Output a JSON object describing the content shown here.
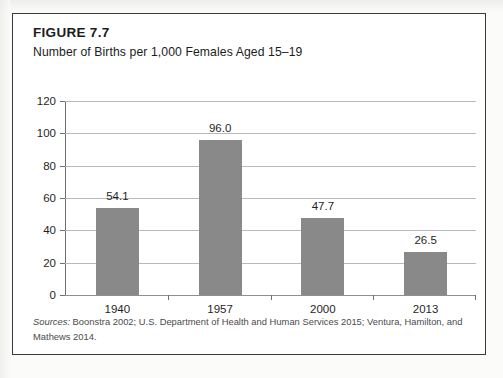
{
  "figure": {
    "label": "FIGURE 7.7",
    "title": "Number of Births per 1,000 Females Aged 15–19",
    "source_lead": "Sources:",
    "source_text": " Boonstra 2002; U.S. Department of Health and Human Services 2015; Ventura, Hamilton, and Mathews 2014."
  },
  "colors": {
    "bar_fill": "#898989",
    "frame": "#3a3a3a",
    "gridline": "#b9b9b9",
    "axis": "#6f6f6f",
    "text": "#1c1c1c"
  },
  "chart_data": {
    "type": "bar",
    "title": "Number of Births per 1,000 Females Aged 15–19",
    "xlabel": "",
    "ylabel": "",
    "categories": [
      "1940",
      "1957",
      "2000",
      "2013"
    ],
    "values": [
      54.1,
      96.0,
      47.7,
      26.5
    ],
    "value_labels": [
      "54.1",
      "96.0",
      "47.7",
      "26.5"
    ],
    "ylim": [
      0,
      120
    ],
    "yticks": [
      0,
      20,
      40,
      60,
      80,
      100,
      120
    ],
    "ytick_labels": [
      "0",
      "20",
      "40",
      "60",
      "80",
      "100",
      "120"
    ],
    "grid": true,
    "legend": null
  }
}
